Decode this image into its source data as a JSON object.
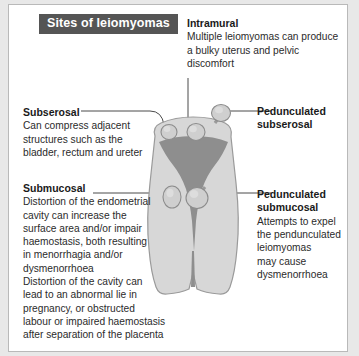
{
  "figure": {
    "title": "Sites of leiomyomas",
    "title_bg": "#555555",
    "title_color": "#ffffff",
    "background": "#ffffff",
    "border_color": "#b9b9b9",
    "page_background": "#e8e8e8"
  },
  "diagram": {
    "name": "uterus-cross-section",
    "myometrium_color": "#d7d7d7",
    "myometrium_outline": "#9a9a9a",
    "cavity_color": "#8e8e8e",
    "nodule_color": "#c9c9c9",
    "nodule_outline": "#8c8c8c",
    "leader_color": "#4a4a4a",
    "nodules": [
      {
        "name": "subserosal-nodule",
        "cx": 160,
        "cy": 127,
        "r": 8
      },
      {
        "name": "intramural-nodule",
        "cx": 187,
        "cy": 127,
        "r": 9
      },
      {
        "name": "pedunculated-subserosal-nodule",
        "cx": 212,
        "cy": 108,
        "r": 9
      },
      {
        "name": "submucosal-nodule",
        "cx": 163,
        "cy": 192,
        "r": 10
      },
      {
        "name": "pedunculated-submucosal-nodule",
        "cx": 188,
        "cy": 193,
        "r": 11
      }
    ]
  },
  "labels": {
    "intramural": {
      "heading": "Intramural",
      "body": "Multiple  leiomyomas can produce\na bulky uterus and pelvic\ndiscomfort"
    },
    "subserosal": {
      "heading": "Subserosal",
      "body": "Can compress adjacent\nstructures such as the\nbladder, rectum and ureter"
    },
    "submucosal": {
      "heading": "Submucosal",
      "body": "Distortion of the endometrial\ncavity can increase the\nsurface area and/or impair\nhaemostasis, both resulting\nin menorrhagia and/or\ndysmenorrhoea"
    },
    "submucosal_second": {
      "body": "Distortion of the cavity can\nlead to an abnormal lie in\npregnancy, or obstructed\nlabour or impaired haemostasis\nafter separation of the placenta"
    },
    "pedunculated_subserosal": {
      "heading": "Pedunculated\nsubserosal",
      "body": ""
    },
    "pedunculated_submucosal": {
      "heading": "Pedunculated\nsubmucosal",
      "body": "Attempts to expel\nthe pendunculated\nleiomyomas\nmay cause\ndysmenorrhoea"
    }
  }
}
